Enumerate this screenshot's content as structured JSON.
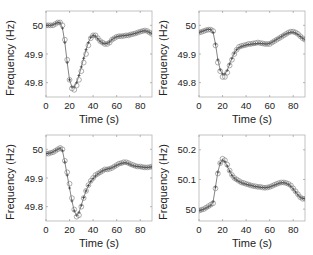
{
  "chart_data": [
    {
      "type": "line",
      "panel": "top-left",
      "title": "",
      "xlabel": "Time (s)",
      "ylabel": "Frequency (Hz)",
      "xlim": [
        0,
        90
      ],
      "ylim": [
        49.75,
        50.05
      ],
      "xticks": [
        0,
        20,
        40,
        60,
        80
      ],
      "yticks": [
        49.8,
        49.9,
        50
      ],
      "ytick_labels": [
        "49.8",
        "49.9",
        "50"
      ],
      "grid": false,
      "series": [
        {
          "name": "measured",
          "marker": "circle",
          "x": [
            0,
            2,
            4,
            6,
            8,
            10,
            12,
            14,
            16,
            18,
            20,
            22,
            24,
            26,
            28,
            30,
            32,
            34,
            36,
            38,
            40,
            42,
            44,
            46,
            48,
            50,
            52,
            54,
            56,
            58,
            60,
            62,
            64,
            66,
            68,
            70,
            72,
            74,
            76,
            78,
            80,
            82,
            84,
            86,
            88,
            90
          ],
          "values": [
            50.0,
            50.0,
            50.0,
            50.0,
            50.005,
            50.01,
            50.01,
            50.0,
            49.95,
            49.88,
            49.81,
            49.78,
            49.775,
            49.79,
            49.81,
            49.84,
            49.87,
            49.9,
            49.93,
            49.955,
            49.965,
            49.965,
            49.955,
            49.945,
            49.94,
            49.935,
            49.935,
            49.94,
            49.95,
            49.955,
            49.96,
            49.962,
            49.962,
            49.963,
            49.965,
            49.965,
            49.968,
            49.97,
            49.972,
            49.975,
            49.978,
            49.98,
            49.982,
            49.98,
            49.975,
            49.97
          ]
        },
        {
          "name": "model",
          "marker": "plus",
          "x": [
            0,
            2,
            4,
            6,
            8,
            10,
            12,
            14,
            16,
            18,
            20,
            22,
            24,
            26,
            28,
            30,
            32,
            34,
            36,
            38,
            40,
            42,
            44,
            46,
            48,
            50,
            52,
            54,
            56,
            58,
            60,
            62,
            64,
            66,
            68,
            70,
            72,
            74,
            76,
            78,
            80,
            82,
            84,
            86,
            88,
            90
          ],
          "values": [
            50.0,
            50.0,
            50.0,
            50.002,
            50.006,
            50.01,
            50.008,
            49.99,
            49.94,
            49.87,
            49.81,
            49.785,
            49.785,
            49.8,
            49.825,
            49.855,
            49.885,
            49.915,
            49.94,
            49.958,
            49.965,
            49.962,
            49.953,
            49.944,
            49.938,
            49.936,
            49.937,
            49.942,
            49.95,
            49.956,
            49.96,
            49.962,
            49.963,
            49.964,
            49.965,
            49.966,
            49.968,
            49.97,
            49.972,
            49.975,
            49.978,
            49.98,
            49.981,
            49.979,
            49.975,
            49.971
          ]
        }
      ]
    },
    {
      "type": "line",
      "panel": "top-right",
      "title": "",
      "xlabel": "Time (s)",
      "ylabel": "Frequency (Hz)",
      "xlim": [
        0,
        90
      ],
      "ylim": [
        49.75,
        50.05
      ],
      "xticks": [
        0,
        20,
        40,
        60,
        80
      ],
      "yticks": [
        49.8,
        49.9,
        50
      ],
      "ytick_labels": [
        "49.8",
        "49.9",
        "50"
      ],
      "grid": false,
      "series": [
        {
          "name": "measured",
          "marker": "circle",
          "x": [
            0,
            2,
            4,
            6,
            8,
            10,
            12,
            14,
            16,
            18,
            20,
            22,
            24,
            26,
            28,
            30,
            32,
            34,
            36,
            38,
            40,
            42,
            44,
            46,
            48,
            50,
            52,
            54,
            56,
            58,
            60,
            62,
            64,
            66,
            68,
            70,
            72,
            74,
            76,
            78,
            80,
            82,
            84,
            86,
            88,
            90
          ],
          "values": [
            49.975,
            49.977,
            49.98,
            49.983,
            49.985,
            49.985,
            49.98,
            49.93,
            49.87,
            49.84,
            49.82,
            49.82,
            49.835,
            49.86,
            49.88,
            49.9,
            49.915,
            49.925,
            49.928,
            49.93,
            49.932,
            49.935,
            49.935,
            49.937,
            49.938,
            49.94,
            49.938,
            49.937,
            49.935,
            49.935,
            49.935,
            49.94,
            49.945,
            49.95,
            49.955,
            49.96,
            49.965,
            49.97,
            49.975,
            49.978,
            49.978,
            49.975,
            49.97,
            49.962,
            49.955,
            49.95
          ]
        },
        {
          "name": "model",
          "marker": "plus",
          "x": [
            0,
            2,
            4,
            6,
            8,
            10,
            12,
            14,
            16,
            18,
            20,
            22,
            24,
            26,
            28,
            30,
            32,
            34,
            36,
            38,
            40,
            42,
            44,
            46,
            48,
            50,
            52,
            54,
            56,
            58,
            60,
            62,
            64,
            66,
            68,
            70,
            72,
            74,
            76,
            78,
            80,
            82,
            84,
            86,
            88,
            90
          ],
          "values": [
            49.975,
            49.978,
            49.981,
            49.984,
            49.986,
            49.985,
            49.975,
            49.935,
            49.88,
            49.845,
            49.83,
            49.83,
            49.843,
            49.865,
            49.885,
            49.903,
            49.915,
            49.922,
            49.926,
            49.929,
            49.931,
            49.933,
            49.934,
            49.935,
            49.936,
            49.937,
            49.937,
            49.936,
            49.935,
            49.935,
            49.937,
            49.941,
            49.946,
            49.951,
            49.956,
            49.961,
            49.966,
            49.97,
            49.974,
            49.976,
            49.976,
            49.973,
            49.968,
            49.961,
            49.955,
            49.95
          ]
        }
      ]
    },
    {
      "type": "line",
      "panel": "bottom-left",
      "title": "",
      "xlabel": "Time (s)",
      "ylabel": "Frequency (Hz)",
      "xlim": [
        0,
        90
      ],
      "ylim": [
        49.75,
        50.05
      ],
      "xticks": [
        0,
        20,
        40,
        60,
        80
      ],
      "yticks": [
        49.8,
        49.9,
        50
      ],
      "ytick_labels": [
        "49.8",
        "49.9",
        "50"
      ],
      "grid": false,
      "series": [
        {
          "name": "measured",
          "marker": "circle",
          "x": [
            0,
            2,
            4,
            6,
            8,
            10,
            12,
            14,
            16,
            18,
            20,
            22,
            24,
            26,
            28,
            30,
            32,
            34,
            36,
            38,
            40,
            42,
            44,
            46,
            48,
            50,
            52,
            54,
            56,
            58,
            60,
            62,
            64,
            66,
            68,
            70,
            72,
            74,
            76,
            78,
            80,
            82,
            84,
            86,
            88,
            90
          ],
          "values": [
            49.985,
            49.985,
            49.988,
            49.99,
            49.995,
            50.0,
            50.005,
            50.0,
            49.96,
            49.92,
            49.88,
            49.83,
            49.79,
            49.765,
            49.77,
            49.8,
            49.83,
            49.855,
            49.875,
            49.89,
            49.9,
            49.91,
            49.915,
            49.92,
            49.925,
            49.93,
            49.93,
            49.932,
            49.935,
            49.94,
            49.945,
            49.95,
            49.952,
            49.955,
            49.955,
            49.952,
            49.948,
            49.945,
            49.942,
            49.94,
            49.94,
            49.938,
            49.937,
            49.937,
            49.938,
            49.94
          ]
        },
        {
          "name": "model",
          "marker": "plus",
          "x": [
            0,
            2,
            4,
            6,
            8,
            10,
            12,
            14,
            16,
            18,
            20,
            22,
            24,
            26,
            28,
            30,
            32,
            34,
            36,
            38,
            40,
            42,
            44,
            46,
            48,
            50,
            52,
            54,
            56,
            58,
            60,
            62,
            64,
            66,
            68,
            70,
            72,
            74,
            76,
            78,
            80,
            82,
            84,
            86,
            88,
            90
          ],
          "values": [
            49.985,
            49.986,
            49.988,
            49.991,
            49.996,
            50.0,
            50.004,
            49.995,
            49.955,
            49.91,
            49.865,
            49.82,
            49.785,
            49.77,
            49.78,
            49.805,
            49.832,
            49.855,
            49.874,
            49.888,
            49.898,
            49.907,
            49.914,
            49.92,
            49.925,
            49.929,
            49.931,
            49.933,
            49.936,
            49.94,
            49.944,
            49.948,
            49.951,
            49.953,
            49.953,
            49.95,
            49.946,
            49.943,
            49.941,
            49.94,
            49.939,
            49.938,
            49.937,
            49.937,
            49.938,
            49.939
          ]
        }
      ]
    },
    {
      "type": "line",
      "panel": "bottom-right",
      "title": "",
      "xlabel": "Time (s)",
      "ylabel": "Frequency (Hz)",
      "xlim": [
        0,
        90
      ],
      "ylim": [
        49.96,
        50.25
      ],
      "xticks": [
        0,
        20,
        40,
        60,
        80
      ],
      "yticks": [
        50,
        50.1,
        50.2
      ],
      "ytick_labels": [
        "50",
        "50.1",
        "50.2"
      ],
      "grid": false,
      "series": [
        {
          "name": "measured",
          "marker": "circle",
          "x": [
            0,
            2,
            4,
            6,
            8,
            10,
            12,
            14,
            16,
            18,
            20,
            22,
            24,
            26,
            28,
            30,
            32,
            34,
            36,
            38,
            40,
            42,
            44,
            46,
            48,
            50,
            52,
            54,
            56,
            58,
            60,
            62,
            64,
            66,
            68,
            70,
            72,
            74,
            76,
            78,
            80,
            82,
            84,
            86,
            88,
            90
          ],
          "values": [
            49.995,
            49.998,
            50.0,
            50.005,
            50.01,
            50.015,
            50.02,
            50.07,
            50.12,
            50.155,
            50.17,
            50.165,
            50.15,
            50.13,
            50.115,
            50.105,
            50.1,
            50.095,
            50.09,
            50.088,
            50.085,
            50.083,
            50.08,
            50.078,
            50.077,
            50.075,
            50.075,
            50.073,
            50.072,
            50.073,
            50.075,
            50.078,
            50.082,
            50.085,
            50.088,
            50.09,
            50.09,
            50.088,
            50.085,
            50.08,
            50.07,
            50.06,
            50.05,
            50.04,
            50.035,
            50.035
          ]
        },
        {
          "name": "model",
          "marker": "plus",
          "x": [
            0,
            2,
            4,
            6,
            8,
            10,
            12,
            14,
            16,
            18,
            20,
            22,
            24,
            26,
            28,
            30,
            32,
            34,
            36,
            38,
            40,
            42,
            44,
            46,
            48,
            50,
            52,
            54,
            56,
            58,
            60,
            62,
            64,
            66,
            68,
            70,
            72,
            74,
            76,
            78,
            80,
            82,
            84,
            86,
            88,
            90
          ],
          "values": [
            49.995,
            49.997,
            50.0,
            50.004,
            50.008,
            50.013,
            50.025,
            50.075,
            50.125,
            50.155,
            50.165,
            50.16,
            50.145,
            50.128,
            50.114,
            50.104,
            50.098,
            50.093,
            50.089,
            50.086,
            50.084,
            50.082,
            50.08,
            50.078,
            50.076,
            50.075,
            50.074,
            50.073,
            50.072,
            50.073,
            50.075,
            50.078,
            50.081,
            50.084,
            50.087,
            50.089,
            50.089,
            50.087,
            50.083,
            50.077,
            50.068,
            50.058,
            50.048,
            50.04,
            50.036,
            50.035
          ]
        }
      ]
    }
  ]
}
